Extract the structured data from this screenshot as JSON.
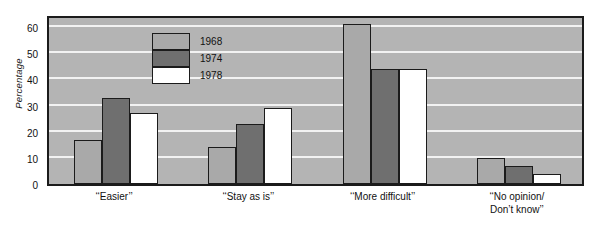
{
  "chart_data": {
    "type": "bar",
    "title": "",
    "subtitle": "",
    "xlabel": "",
    "ylabel": "Percentage",
    "categories": [
      "‘‘Easier’’",
      "‘‘Stay as is’’",
      "‘‘More  difficult’’",
      "‘‘No opinion/\nDon’t know’’"
    ],
    "series": [
      {
        "name": "1968",
        "color": "#a9a9a9",
        "values": [
          17,
          14,
          61,
          10
        ]
      },
      {
        "name": "1974",
        "color": "#6f6f6f",
        "values": [
          33,
          23,
          44,
          7
        ]
      },
      {
        "name": "1978",
        "color": "#ffffff",
        "values": [
          27,
          29,
          44,
          4
        ]
      }
    ],
    "ylim": [
      0,
      65
    ],
    "yticks": [
      0,
      10,
      20,
      30,
      40,
      50,
      60
    ],
    "ytick_labels": [
      "0",
      "10",
      "20",
      "30",
      "40",
      "50",
      "60"
    ],
    "grid": true,
    "grid_axis": "y",
    "legend_position": "upper-left-inside",
    "plot_background": "#b4b4b4",
    "gridline_color": "#f2f2f2",
    "axis_color": "#1b1b1b"
  },
  "legend": {
    "items": [
      {
        "label": "1968"
      },
      {
        "label": "1974"
      },
      {
        "label": "1978"
      }
    ]
  }
}
